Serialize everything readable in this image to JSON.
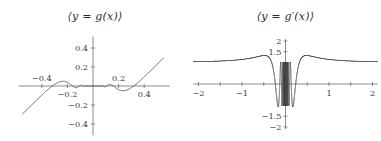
{
  "figure": {
    "background": "#ffffff",
    "curve_color": "#4a4a4a",
    "axis_color": "#6f6f6f",
    "label_color": "#3a3a3a"
  },
  "panels": [
    {
      "id": "left",
      "title": "⟨y = g(x)⟩",
      "title_plain": "y = g(x)"
    },
    {
      "id": "right",
      "title": "⟨y = g′(x)⟩",
      "title_plain": "y = g'(x)"
    }
  ],
  "chart_data": [
    {
      "type": "line",
      "id": "g-of-x",
      "title": "⟨y = g(x)⟩",
      "xlabel": "",
      "ylabel": "",
      "function": "x^2 * sin(1/x)",
      "xlim": [
        -0.55,
        0.55
      ],
      "ylim": [
        -0.5,
        0.5
      ],
      "grid": false,
      "legend": "none",
      "x_ticks": [
        -0.4,
        -0.2,
        0.2,
        0.4
      ],
      "x_tick_labels": [
        "-0.4",
        "-0.2",
        "0.2",
        "0.4"
      ],
      "x_tick_label_side": [
        "above",
        "below",
        "above",
        "below"
      ],
      "y_ticks": [
        -0.4,
        -0.2,
        0.2,
        0.4
      ],
      "y_tick_labels": [
        "-0.4",
        "-0.2",
        "0.2",
        "0.4"
      ],
      "x": [
        -0.55,
        -0.5,
        -0.45,
        -0.4,
        -0.35,
        -0.3,
        -0.25,
        -0.22,
        -0.2,
        -0.18,
        -0.16,
        -0.14,
        -0.12,
        -0.1,
        -0.08,
        -0.06,
        -0.05,
        -0.04,
        -0.03,
        -0.02,
        -0.01,
        0,
        0.01,
        0.02,
        0.03,
        0.04,
        0.05,
        0.06,
        0.08,
        0.1,
        0.12,
        0.14,
        0.16,
        0.18,
        0.2,
        0.22,
        0.25,
        0.3,
        0.35,
        0.4,
        0.45,
        0.5,
        0.55
      ],
      "y": [
        -0.2774,
        -0.2397,
        -0.1979,
        -0.1536,
        -0.1095,
        -0.0694,
        -0.0374,
        -0.0226,
        -0.0151,
        -0.0092,
        -0.0049,
        -0.002,
        0.0001,
        0.0054,
        0.0064,
        -0.0013,
        0.0013,
        0.0011,
        -0.0004,
        -0.0002,
        0.0001,
        0,
        -0.0001,
        0.0002,
        0.0004,
        -0.0011,
        -0.0013,
        0.0013,
        -0.0064,
        -0.0054,
        -0.0001,
        0.002,
        0.0049,
        0.0092,
        0.0151,
        0.0226,
        0.0374,
        0.0694,
        0.1095,
        0.1536,
        0.1979,
        0.2397,
        0.2774
      ]
    },
    {
      "type": "line",
      "id": "g-prime-of-x",
      "title": "⟨y = g′(x)⟩",
      "xlabel": "",
      "ylabel": "",
      "function": "2x*sin(1/x) - cos(1/x)",
      "xlim": [
        -2,
        2
      ],
      "ylim": [
        -2,
        2
      ],
      "grid": false,
      "legend": "none",
      "x_ticks": [
        -2,
        -1.5,
        -1,
        -0.5,
        0.5,
        1,
        1.5,
        2
      ],
      "x_major_ticks": [
        -2,
        -1,
        1,
        2
      ],
      "x_tick_labels": [
        "-2",
        "-1",
        "1",
        "2"
      ],
      "y_ticks": [
        -2,
        -1.5,
        1.5,
        2
      ],
      "y_tick_labels": [
        "-2",
        "-1.5",
        "1.5",
        "2"
      ],
      "oscillation_band": [
        -0.13,
        0.13
      ],
      "asymptote_value": 1.0,
      "peak_value": 1.52,
      "peak_x": -0.3
    }
  ]
}
